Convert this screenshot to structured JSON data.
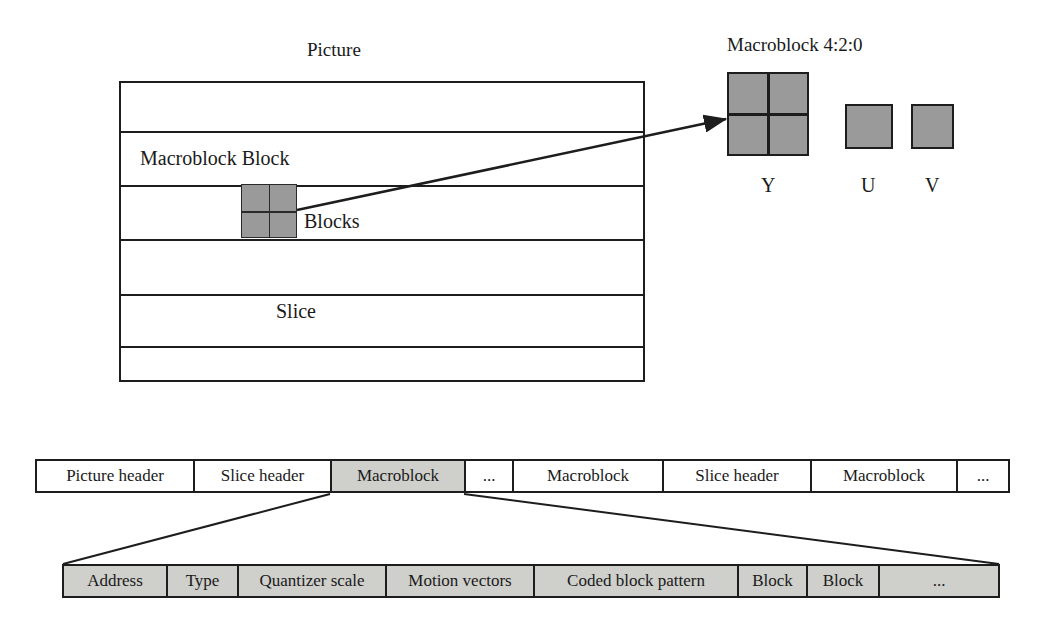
{
  "diagram": {
    "picture": {
      "title": "Picture",
      "annotations": [
        {
          "name": "macroblock-block-label",
          "text": "Macroblock Block"
        },
        {
          "name": "blocks-label",
          "text": "Blocks"
        },
        {
          "name": "slice-label",
          "text": "Slice"
        }
      ],
      "slice_count": 6
    },
    "macroblock420": {
      "title": "Macroblock 4:2:0",
      "components": [
        {
          "name": "y",
          "label": "Y",
          "subblocks": 4
        },
        {
          "name": "u",
          "label": "U",
          "subblocks": 1
        },
        {
          "name": "v",
          "label": "V",
          "subblocks": 1
        }
      ]
    },
    "stream_bar": {
      "name": "video-bitstream-bar",
      "cells": [
        {
          "label": "Picture header",
          "shaded": false
        },
        {
          "label": "Slice header",
          "shaded": false
        },
        {
          "label": "Macroblock",
          "shaded": true
        },
        {
          "label": "...",
          "shaded": false
        },
        {
          "label": "Macroblock",
          "shaded": false
        },
        {
          "label": "Slice header",
          "shaded": false
        },
        {
          "label": "Macroblock",
          "shaded": false
        },
        {
          "label": "...",
          "shaded": false
        }
      ]
    },
    "macroblock_detail_bar": {
      "name": "macroblock-layer-bar",
      "cells": [
        {
          "label": "Address"
        },
        {
          "label": "Type"
        },
        {
          "label": "Quantizer scale"
        },
        {
          "label": "Motion vectors"
        },
        {
          "label": "Coded block pattern"
        },
        {
          "label": "Block"
        },
        {
          "label": "Block"
        },
        {
          "label": "..."
        }
      ]
    },
    "colors": {
      "block_fill": "#9a9a9a",
      "cell_shaded_fill": "#cfcfcb",
      "stroke": "#1d1d1d",
      "background": "#ffffff"
    }
  }
}
